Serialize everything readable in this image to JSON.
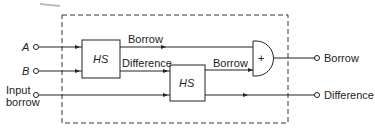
{
  "diagram": {
    "inputs": {
      "a": "A",
      "b": "B",
      "borrow_in_line1": "Input",
      "borrow_in_line2": "borrow"
    },
    "blocks": {
      "hs1": "HS",
      "hs2": "HS",
      "or_gate": "+"
    },
    "signals": {
      "hs1_borrow": "Borrow",
      "hs1_difference": "Difference",
      "hs2_borrow": "Borrow"
    },
    "outputs": {
      "borrow": "Borrow",
      "difference": "Difference"
    },
    "colors": {
      "line": "#222222",
      "background": "#ffffff"
    }
  }
}
